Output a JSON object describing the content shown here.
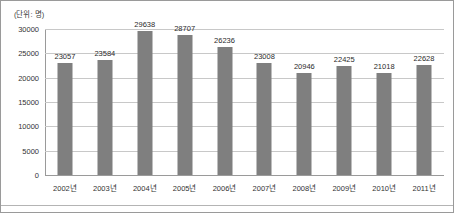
{
  "unit_note": "(단위: 명)",
  "chart_data": {
    "type": "bar",
    "title": "",
    "subtitle": "",
    "xlabel": "",
    "ylabel": "",
    "unit_note": "(단위: 명)",
    "ylim": [
      0,
      30000
    ],
    "yticks": [
      0,
      5000,
      10000,
      15000,
      20000,
      25000,
      30000
    ],
    "ytick_labels": [
      "0",
      "5000",
      "10000",
      "15000",
      "20000",
      "25000",
      "30000"
    ],
    "grid": true,
    "legend": false,
    "legend_position": "none",
    "bar_color": "#7f7f7f",
    "categories": [
      "2002년",
      "2003년",
      "2004년",
      "2005년",
      "2006년",
      "2007년",
      "2008년",
      "2009년",
      "2010년",
      "2011년"
    ],
    "values": [
      23057,
      23584,
      29638,
      28707,
      26236,
      23008,
      20946,
      22425,
      21018,
      22628
    ],
    "data_labels": [
      "23057",
      "23584",
      "29638",
      "28707",
      "26236",
      "23008",
      "20946",
      "22425",
      "21018",
      "22628"
    ]
  }
}
